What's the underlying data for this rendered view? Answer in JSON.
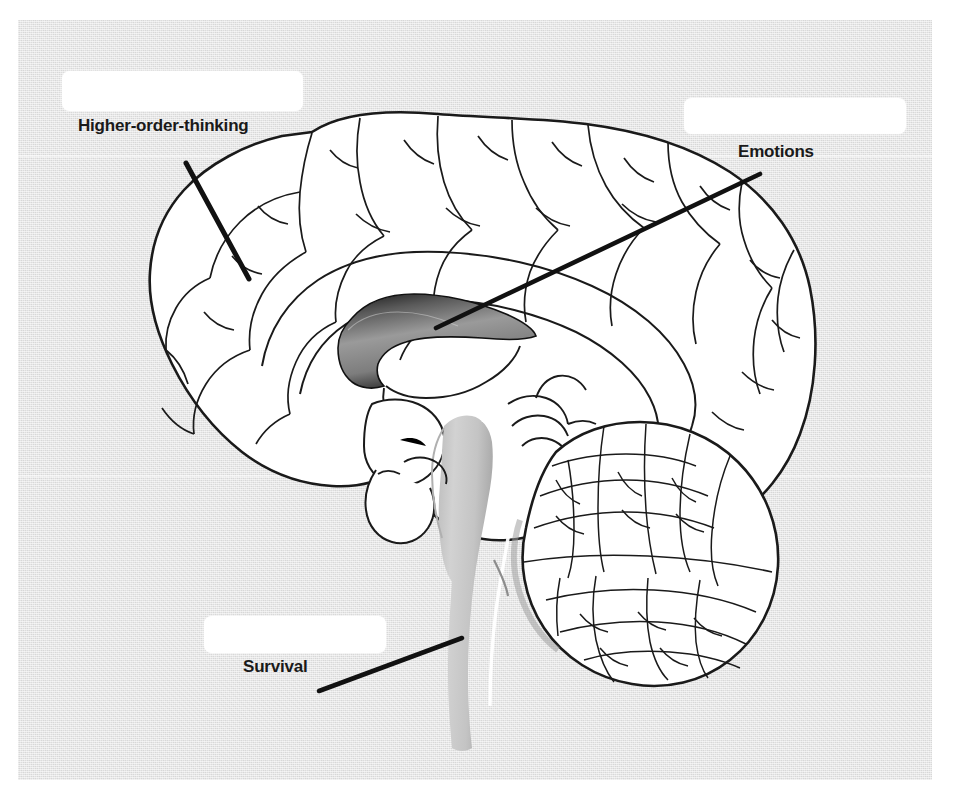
{
  "diagram": {
    "background_color": "#dcdcdc",
    "page_color": "#ffffff",
    "ink_color": "#1a1a1a"
  },
  "answers": [
    {
      "id": "higher-order-thinking",
      "label": "Higher-order-thinking",
      "value": "",
      "placeholder": "",
      "box": {
        "x": 62,
        "y": 71,
        "w": 241,
        "h": 40
      },
      "leader_line": {
        "x1": 186,
        "y1": 163,
        "x2": 249,
        "y2": 279
      },
      "points_to": "cerebral-cortex"
    },
    {
      "id": "emotions",
      "label": "Emotions",
      "value": "",
      "placeholder": "",
      "box": {
        "x": 684,
        "y": 98,
        "w": 222,
        "h": 36
      },
      "leader_line": {
        "x1": 760,
        "y1": 174,
        "x2": 436,
        "y2": 328
      },
      "points_to": "corpus-callosum-limbic"
    },
    {
      "id": "survival",
      "label": "Survival",
      "value": "",
      "placeholder": "",
      "box": {
        "x": 204,
        "y": 616,
        "w": 182,
        "h": 37
      },
      "leader_line": {
        "x1": 319,
        "y1": 691,
        "x2": 462,
        "y2": 638
      },
      "points_to": "brainstem"
    }
  ],
  "structures": [
    {
      "id": "cerebral-cortex",
      "name": "Cerebral cortex"
    },
    {
      "id": "corpus-callosum",
      "name": "Corpus callosum",
      "shaded": true
    },
    {
      "id": "cerebellum",
      "name": "Cerebellum"
    },
    {
      "id": "brainstem",
      "name": "Brainstem",
      "shaded": true
    },
    {
      "id": "thalamus",
      "name": "Thalamus"
    }
  ]
}
